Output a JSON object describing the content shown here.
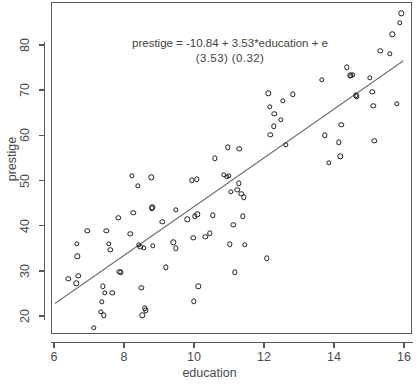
{
  "chart_data": {
    "type": "scatter",
    "title": "",
    "xlabel": "education",
    "ylabel": "prestige",
    "xlim": [
      6,
      16
    ],
    "ylim": [
      15.5,
      88.5
    ],
    "xticks": [
      6,
      8,
      10,
      12,
      14,
      16
    ],
    "yticks": [
      20,
      30,
      40,
      50,
      60,
      70,
      80
    ],
    "grid": false,
    "legend": null,
    "annotations": [
      "prestige = -10.84 + 3.53*education + e",
      "(3.53)   (0.32)"
    ],
    "regression": {
      "intercept": -10.84,
      "slope": 3.53,
      "intercept_se": 3.53,
      "slope_se": 0.32,
      "line_color": "#6f6f72",
      "x_start": 6.0,
      "y_start": 22.6,
      "x_end": 16.0,
      "y_end": 76.6
    },
    "marker": {
      "shape": "open-circle",
      "edge_color": "#1d1d1f",
      "fill": "none",
      "size_px": 5.4
    },
    "points": [
      [
        6.38,
        28.5
      ],
      [
        6.62,
        36.2
      ],
      [
        6.64,
        33.4
      ],
      [
        6.67,
        29.1
      ],
      [
        6.61,
        27.5
      ],
      [
        6.92,
        39.1
      ],
      [
        7.11,
        17.6
      ],
      [
        7.3,
        21.1
      ],
      [
        7.33,
        23.4
      ],
      [
        7.36,
        26.8
      ],
      [
        7.4,
        20.4
      ],
      [
        7.42,
        25.4
      ],
      [
        7.47,
        39.1
      ],
      [
        7.54,
        36.2
      ],
      [
        7.58,
        34.9
      ],
      [
        7.64,
        25.3
      ],
      [
        7.81,
        42.0
      ],
      [
        7.84,
        30.0
      ],
      [
        7.88,
        29.9
      ],
      [
        8.15,
        38.4
      ],
      [
        8.2,
        51.2
      ],
      [
        8.24,
        43.1
      ],
      [
        8.37,
        49.0
      ],
      [
        8.4,
        36.0
      ],
      [
        8.44,
        35.6
      ],
      [
        8.47,
        26.4
      ],
      [
        8.49,
        20.4
      ],
      [
        8.54,
        35.3
      ],
      [
        8.57,
        21.9
      ],
      [
        8.6,
        21.5
      ],
      [
        8.75,
        50.9
      ],
      [
        8.76,
        44.1
      ],
      [
        8.78,
        44.3
      ],
      [
        8.8,
        35.8
      ],
      [
        9.07,
        41.1
      ],
      [
        9.17,
        31.0
      ],
      [
        9.38,
        36.5
      ],
      [
        9.45,
        43.7
      ],
      [
        9.46,
        35.2
      ],
      [
        9.78,
        41.6
      ],
      [
        9.9,
        50.3
      ],
      [
        9.95,
        37.5
      ],
      [
        9.97,
        23.5
      ],
      [
        10.0,
        42.3
      ],
      [
        10.05,
        50.5
      ],
      [
        10.07,
        42.7
      ],
      [
        10.09,
        26.8
      ],
      [
        10.29,
        37.7
      ],
      [
        10.43,
        38.5
      ],
      [
        10.5,
        42.5
      ],
      [
        10.57,
        55.1
      ],
      [
        10.83,
        51.5
      ],
      [
        10.91,
        51.1
      ],
      [
        10.94,
        57.6
      ],
      [
        10.97,
        51.3
      ],
      [
        11.0,
        36.1
      ],
      [
        11.03,
        47.7
      ],
      [
        11.09,
        40.4
      ],
      [
        11.13,
        29.9
      ],
      [
        11.21,
        48.2
      ],
      [
        11.25,
        49.6
      ],
      [
        11.27,
        57.2
      ],
      [
        11.32,
        47.3
      ],
      [
        11.36,
        42.3
      ],
      [
        11.4,
        46.5
      ],
      [
        11.43,
        36.0
      ],
      [
        12.05,
        33.0
      ],
      [
        12.09,
        69.5
      ],
      [
        12.14,
        66.6
      ],
      [
        12.15,
        60.4
      ],
      [
        12.26,
        62.2
      ],
      [
        12.27,
        65.0
      ],
      [
        12.46,
        63.7
      ],
      [
        12.51,
        67.9
      ],
      [
        12.6,
        58.1
      ],
      [
        12.79,
        69.3
      ],
      [
        13.62,
        72.5
      ],
      [
        13.71,
        60.2
      ],
      [
        13.83,
        54.2
      ],
      [
        14.11,
        58.7
      ],
      [
        14.15,
        55.6
      ],
      [
        14.18,
        62.6
      ],
      [
        14.33,
        75.3
      ],
      [
        14.44,
        73.5
      ],
      [
        14.46,
        73.4
      ],
      [
        14.5,
        73.6
      ],
      [
        14.59,
        69.1
      ],
      [
        14.62,
        68.9
      ],
      [
        14.99,
        73.0
      ],
      [
        15.07,
        69.8
      ],
      [
        15.09,
        66.8
      ],
      [
        15.12,
        59.0
      ],
      [
        15.29,
        78.9
      ],
      [
        15.56,
        78.3
      ],
      [
        15.64,
        82.6
      ],
      [
        15.77,
        67.2
      ],
      [
        15.85,
        85.1
      ],
      [
        15.89,
        87.2
      ]
    ]
  },
  "axes": {
    "x_title": "education",
    "y_title": "prestige",
    "x_tick_labels": [
      "6",
      "8",
      "10",
      "12",
      "14",
      "16"
    ],
    "y_tick_labels": [
      "20",
      "30",
      "40",
      "50",
      "60",
      "70",
      "80"
    ]
  },
  "annotation": {
    "equation": "prestige = -10.84 + 3.53*education + e",
    "std_errors": "(3.53)   (0.32)"
  },
  "colors": {
    "background": "#ffffff",
    "frame": "#58585a",
    "text": "#4a4a4c",
    "marker_edge": "#1d1d1f",
    "regression_line": "#6f6f72"
  }
}
